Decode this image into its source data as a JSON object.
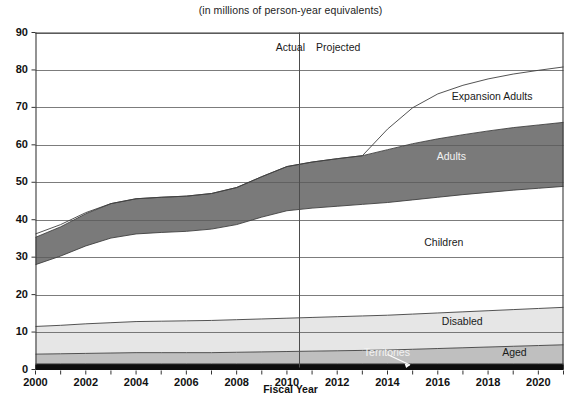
{
  "chart_data": {
    "type": "area",
    "title": "(in millions of person-year equivalents)",
    "xlabel": "Fiscal Year",
    "ylabel": "",
    "xlim": [
      2000,
      2021
    ],
    "ylim": [
      0,
      90
    ],
    "ytick_step": 10,
    "xtick_step": 2,
    "grid": true,
    "legend_position": "inline-labels",
    "xticks": [
      "2000",
      "2002",
      "2004",
      "2006",
      "2008",
      "2010",
      "2012",
      "2014",
      "2016",
      "2018",
      "2020"
    ],
    "yticks": [
      "0",
      "10",
      "20",
      "30",
      "40",
      "50",
      "60",
      "70",
      "80",
      "90"
    ],
    "x": [
      2000,
      2001,
      2002,
      2003,
      2004,
      2005,
      2006,
      2007,
      2008,
      2009,
      2010,
      2011,
      2012,
      2013,
      2014,
      2015,
      2016,
      2017,
      2018,
      2019,
      2020,
      2021
    ],
    "stack_order": [
      "Territories",
      "Aged",
      "Disabled",
      "Children",
      "Adults",
      "Expansion Adults"
    ],
    "series": [
      {
        "name": "Territories",
        "color": "#0d0d0d",
        "values": [
          1.5,
          1.5,
          1.5,
          1.5,
          1.5,
          1.5,
          1.5,
          1.5,
          1.5,
          1.5,
          1.5,
          1.5,
          1.5,
          1.5,
          1.5,
          1.5,
          1.5,
          1.5,
          1.5,
          1.5,
          1.5,
          1.5
        ]
      },
      {
        "name": "Aged",
        "color": "#bfbfbf",
        "values": [
          2.6,
          2.7,
          2.8,
          2.9,
          3.0,
          3.0,
          3.0,
          3.0,
          3.1,
          3.2,
          3.3,
          3.4,
          3.5,
          3.6,
          3.7,
          3.9,
          4.1,
          4.3,
          4.5,
          4.7,
          4.9,
          5.1
        ]
      },
      {
        "name": "Disabled",
        "color": "#e6e6e6",
        "values": [
          7.4,
          7.6,
          7.9,
          8.1,
          8.3,
          8.4,
          8.5,
          8.6,
          8.7,
          8.8,
          8.9,
          9.0,
          9.1,
          9.2,
          9.3,
          9.4,
          9.5,
          9.6,
          9.7,
          9.8,
          9.9,
          10.0
        ]
      },
      {
        "name": "Children",
        "color": "#ffffff",
        "values": [
          16.5,
          18.5,
          20.8,
          22.6,
          23.4,
          23.7,
          23.9,
          24.4,
          25.4,
          27.2,
          28.7,
          29.2,
          29.5,
          29.8,
          30.1,
          30.5,
          30.9,
          31.3,
          31.6,
          31.9,
          32.1,
          32.3
        ]
      },
      {
        "name": "Adults",
        "color": "#7a7a7a",
        "values": [
          7.3,
          7.8,
          8.6,
          9.2,
          9.4,
          9.4,
          9.4,
          9.5,
          9.9,
          10.8,
          11.8,
          12.3,
          12.7,
          13.0,
          14.1,
          15.0,
          15.6,
          16.0,
          16.4,
          16.7,
          16.9,
          17.1
        ]
      },
      {
        "name": "Expansion Adults",
        "color": "#ffffff",
        "values": [
          0.9,
          0.6,
          0.3,
          0.0,
          0.0,
          0.0,
          0.0,
          0.0,
          0.0,
          0.0,
          0.0,
          0.0,
          0.0,
          0.0,
          5.5,
          9.6,
          12.0,
          13.2,
          13.9,
          14.3,
          14.6,
          14.8
        ]
      }
    ],
    "totals": [
      36.2,
      38.7,
      41.9,
      44.3,
      45.6,
      46.0,
      46.3,
      47.0,
      48.6,
      51.5,
      54.2,
      55.4,
      56.3,
      57.1,
      64.2,
      69.9,
      73.6,
      75.9,
      77.6,
      78.9,
      79.9,
      80.8
    ],
    "annotations": [
      {
        "name": "actual-label",
        "text": "Actual",
        "x": 2009.6,
        "y": 85.5
      },
      {
        "name": "projected-label",
        "text": "Projected",
        "x": 2011.2,
        "y": 85.5
      },
      {
        "name": "expansion-adults-label",
        "text": "Expansion Adults",
        "x": 2016.6,
        "y": 72.5
      },
      {
        "name": "adults-label",
        "text": "Adults",
        "x": 2016.0,
        "y": 56.5
      },
      {
        "name": "children-label",
        "text": "Children",
        "x": 2015.5,
        "y": 33.5
      },
      {
        "name": "disabled-label",
        "text": "Disabled",
        "x": 2016.2,
        "y": 12.5
      },
      {
        "name": "territories-label",
        "text": "Territories",
        "x": 2013.1,
        "y": 4.2
      },
      {
        "name": "aged-label",
        "text": "Aged",
        "x": 2018.6,
        "y": 4.2
      }
    ],
    "divider": {
      "name": "actual-projected-divider",
      "x": 2010.5,
      "label_left": "Actual",
      "label_right": "Projected"
    },
    "territories_leader": {
      "from_x": 2014.0,
      "from_y": 4.0,
      "to_x": 2014.9,
      "to_y": 1.2
    }
  }
}
